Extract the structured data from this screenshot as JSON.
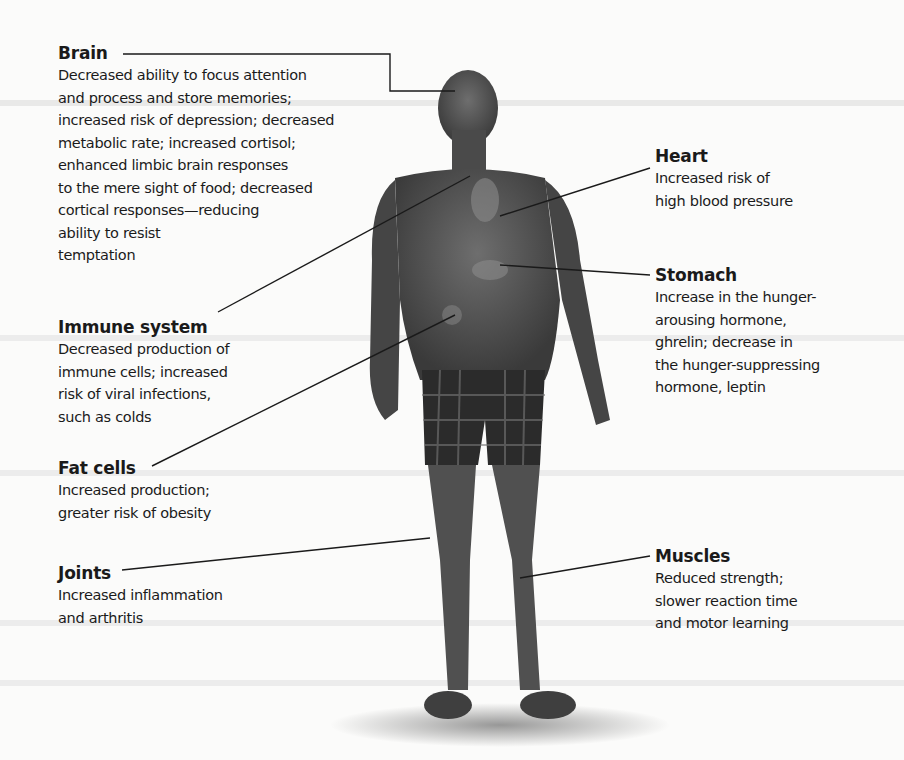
{
  "diagram": {
    "labels": [
      {
        "key": "brain",
        "title": "Brain",
        "description": "Decreased ability to focus attention\nand process and store memories;\nincreased risk of depression; decreased\nmetabolic rate; increased cortisol;\nenhanced limbic brain responses\nto the mere sight of food; decreased\ncortical responses—reducing\nability to resist\ntemptation"
      },
      {
        "key": "heart",
        "title": "Heart",
        "description": "Increased risk of\nhigh blood pressure"
      },
      {
        "key": "stomach",
        "title": "Stomach",
        "description": "Increase in the hunger-\narousing hormone,\nghrelin; decrease in\nthe hunger-suppressing\nhormone, leptin"
      },
      {
        "key": "immune",
        "title": "Immune system",
        "description": "Decreased production of\nimmune cells; increased\nrisk of viral infections,\nsuch as colds"
      },
      {
        "key": "fat",
        "title": "Fat cells",
        "description": "Increased production;\ngreater risk of obesity"
      },
      {
        "key": "joints",
        "title": "Joints",
        "description": "Increased inflammation\nand arthritis"
      },
      {
        "key": "muscles",
        "title": "Muscles",
        "description": "Reduced strength;\nslower reaction time\nand motor learning"
      }
    ]
  }
}
